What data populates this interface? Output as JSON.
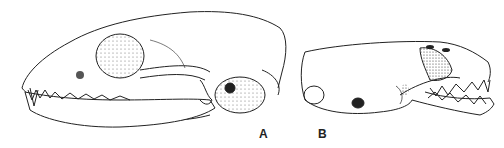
{
  "figure": {
    "panels": [
      {
        "label": "A",
        "subject": "skull lateral view, facing left, large"
      },
      {
        "label": "B",
        "subject": "skull lateral view, facing right, small"
      }
    ],
    "colors": {
      "ink": "#222222",
      "background": "#ffffff"
    }
  }
}
